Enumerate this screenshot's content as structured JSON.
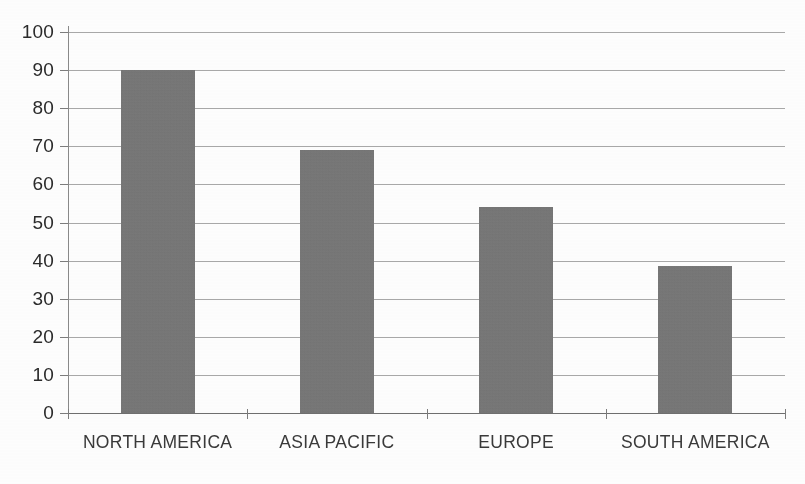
{
  "chart_data": {
    "type": "bar",
    "title": "",
    "subtitle": "",
    "xlabel": "",
    "ylabel": "",
    "categories": [
      "NORTH AMERICA",
      "ASIA PACIFIC",
      "EUROPE",
      "SOUTH AMERICA"
    ],
    "values": [
      90,
      69,
      54,
      38.5
    ],
    "ylim": [
      0,
      100
    ],
    "y_ticks": [
      0,
      10,
      20,
      30,
      40,
      50,
      60,
      70,
      80,
      90,
      100
    ],
    "y_tick_labels": [
      "0",
      "10",
      "20",
      "30",
      "40",
      "50",
      "60",
      "70",
      "80",
      "90",
      "100"
    ],
    "grid": true,
    "grid_axis": "y",
    "legend": false,
    "legend_position": "none",
    "bar_color": "#767676",
    "gridline_color": "#9a9a9a",
    "axis_color": "#6f6f6f",
    "label_color": "#3a3a3a",
    "background_color": "#ffffff",
    "series": [
      {
        "name": "Value",
        "values": [
          90,
          69,
          54,
          38.5
        ]
      }
    ]
  }
}
